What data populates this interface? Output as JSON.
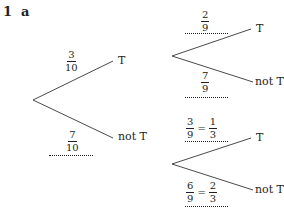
{
  "heading": {
    "question": "1",
    "part": "a"
  },
  "tree": {
    "first": {
      "T": {
        "label": "T",
        "prob": {
          "num": "3",
          "den": "10"
        }
      },
      "notT": {
        "label": "not T",
        "prob": {
          "num": "7",
          "den": "10"
        }
      }
    },
    "second_after_T": {
      "T": {
        "label": "T",
        "prob": {
          "num": "2",
          "den": "9"
        }
      },
      "notT": {
        "label": "not T",
        "prob": {
          "num": "7",
          "den": "9"
        }
      }
    },
    "second_after_notT": {
      "T": {
        "label": "T",
        "prob": {
          "num": "3",
          "den": "9"
        },
        "simplified": {
          "num": "1",
          "den": "3"
        }
      },
      "notT": {
        "label": "not T",
        "prob": {
          "num": "6",
          "den": "9"
        },
        "simplified": {
          "num": "2",
          "den": "3"
        }
      }
    },
    "equals": "="
  }
}
